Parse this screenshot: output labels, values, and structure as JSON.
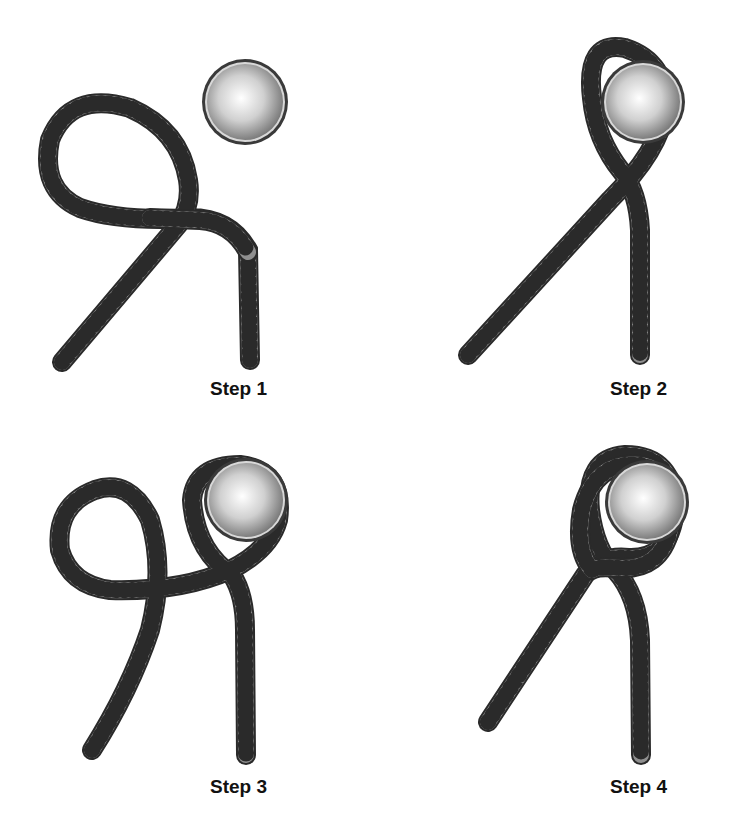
{
  "figure": {
    "colors": {
      "rope_fill": "#8f8f8f",
      "rope_outline": "#2a2a2a",
      "ball_highlight": "#ffffff",
      "ball_shadow": "#7a7a7a",
      "ball_rim": "#444444",
      "label": "#111111",
      "background": "#ffffff"
    },
    "steps": [
      {
        "label": "Step 1",
        "description": "Rope forms a loop beside the ball"
      },
      {
        "label": "Step 2",
        "description": "Loop passed around the ball"
      },
      {
        "label": "Step 3",
        "description": "Second loop formed in the working end"
      },
      {
        "label": "Step 4",
        "description": "Second loop placed over the ball, forming the hitch"
      }
    ]
  }
}
